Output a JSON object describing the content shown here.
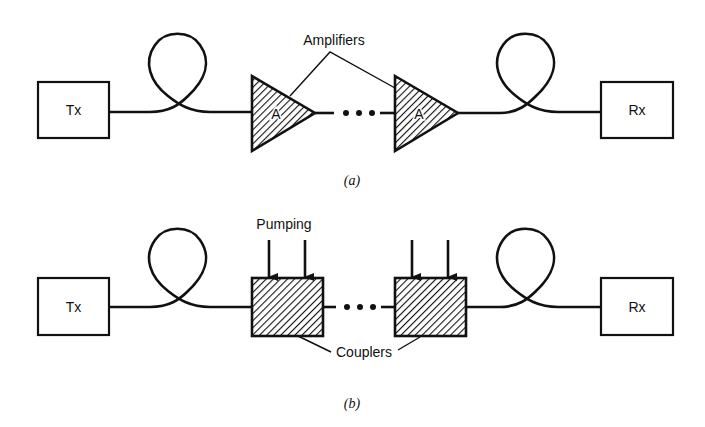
{
  "diagram": {
    "type": "optical-communication-system-block-diagram",
    "colors": {
      "ink": "#111111",
      "background": "#ffffff"
    },
    "panel_a": {
      "caption": "(a)",
      "transmitter_label": "Tx",
      "receiver_label": "Rx",
      "amplifier_symbol_label": "A",
      "amplifier_count_shown": 2,
      "callout_label": "Amplifiers",
      "ellipsis": "•••",
      "elements": [
        "Tx",
        "fiber-loop",
        "amplifier",
        "ellipsis",
        "amplifier",
        "fiber-loop",
        "Rx"
      ]
    },
    "panel_b": {
      "caption": "(b)",
      "transmitter_label": "Tx",
      "receiver_label": "Rx",
      "pump_label": "Pumping",
      "callout_label": "Couplers",
      "coupler_count_shown": 2,
      "pump_arrows_per_coupler": 2,
      "ellipsis": "•••",
      "elements": [
        "Tx",
        "fiber-loop",
        "coupler",
        "ellipsis",
        "coupler",
        "fiber-loop",
        "Rx"
      ]
    }
  }
}
